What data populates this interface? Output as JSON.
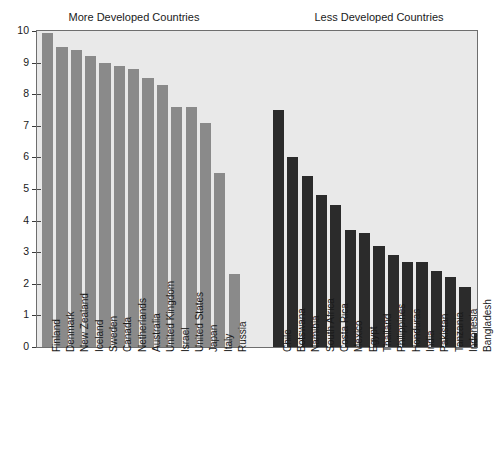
{
  "chart_data": {
    "type": "bar",
    "title": "",
    "xlabel": "",
    "ylabel": "",
    "ylim": [
      0,
      10
    ],
    "ytick_values": [
      0,
      1,
      2,
      3,
      4,
      5,
      6,
      7,
      8,
      9,
      10
    ],
    "ytick_labels": [
      "0",
      "1",
      "2",
      "3",
      "4",
      "5",
      "6",
      "7",
      "8",
      "9",
      "10"
    ],
    "grid": false,
    "legend_position": "none",
    "panels": [
      {
        "title": "More Developed Countries",
        "color": "#8a8a8a",
        "categories": [
          "Finland",
          "Denmark",
          "New Zealand",
          "Iceland",
          "Sweden",
          "Canada",
          "Netherlands",
          "Australia",
          "United Kingdom",
          "Israel",
          "United States",
          "Japan",
          "Italy",
          "Russia"
        ],
        "values": [
          9.95,
          9.5,
          9.4,
          9.2,
          9.0,
          8.9,
          8.8,
          8.5,
          8.3,
          7.6,
          7.6,
          7.1,
          5.5,
          2.3
        ]
      },
      {
        "title": "Less Developed Countries",
        "color": "#2b2b2b",
        "categories": [
          "Chile",
          "Botswana",
          "Namibia",
          "South Africa",
          "Costa Rica",
          "Mexico",
          "Egypt",
          "Thailand",
          "Philippines",
          "Honduras",
          "India",
          "Pakistan",
          "Tanzania",
          "Indonesia",
          "Bangladesh"
        ],
        "values": [
          7.5,
          6.0,
          5.4,
          4.8,
          4.5,
          3.7,
          3.6,
          3.2,
          2.9,
          2.7,
          2.7,
          2.4,
          2.2,
          1.9,
          0.45
        ]
      }
    ]
  },
  "colors": {
    "more_developed_bar": "#8a8a8a",
    "less_developed_bar": "#2b2b2b",
    "plot_background": "#e9e9e9",
    "axis": "#6e6e6e",
    "text": "#1a1a1a",
    "page_background": "#ffffff"
  },
  "titles": {
    "more": "More Developed Countries",
    "less": "Less Developed Countries"
  }
}
